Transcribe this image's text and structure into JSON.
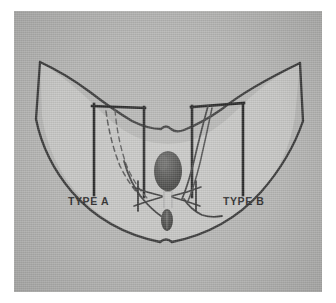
{
  "figure": {
    "plate": {
      "background_color": "#b6b6b4",
      "organ_fill_color": "#c9c9c7",
      "ink_color": "#3a3a3a",
      "dark_structure_color": "#4a4a4a",
      "page_color": "#ffffff"
    },
    "labels": [
      {
        "id": "type-a",
        "text": "TYPE A",
        "x": 68,
        "y": 201
      },
      {
        "id": "type-b",
        "text": "TYPE B",
        "x": 223,
        "y": 201
      }
    ],
    "structures": [
      {
        "id": "pelvic-outline",
        "name": "pelvic-floor-outline"
      },
      {
        "id": "uterus",
        "name": "uterus-body"
      },
      {
        "id": "vagina",
        "name": "vaginal-stump"
      },
      {
        "id": "ureter-left",
        "name": "ureter-left-dashed"
      },
      {
        "id": "ureter-right",
        "name": "ureter-right-solid"
      },
      {
        "id": "bracket-left",
        "name": "resection-bracket-type-a"
      },
      {
        "id": "bracket-right",
        "name": "resection-bracket-type-b"
      },
      {
        "id": "ligament-left",
        "name": "cardinal-ligament-left"
      },
      {
        "id": "ligament-right",
        "name": "cardinal-ligament-right"
      }
    ]
  }
}
